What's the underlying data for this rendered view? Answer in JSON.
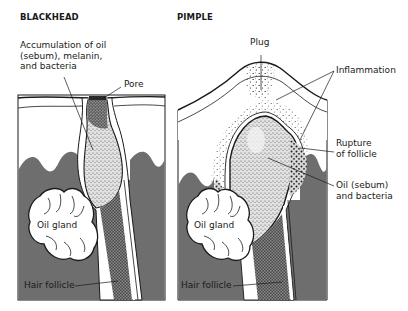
{
  "figure": {
    "panels": [
      {
        "id": "blackhead",
        "title": "BLACKHEAD",
        "labels": {
          "accumulation": [
            "Accumulation of oil",
            "(sebum), melanin,",
            "and bacteria"
          ],
          "pore": "Pore",
          "oil_gland": "Oil gland",
          "hair_follicle": "Hair follicle"
        }
      },
      {
        "id": "pimple",
        "title": "PIMPLE",
        "labels": {
          "plug": "Plug",
          "inflammation": "Inflammation",
          "rupture": [
            "Rupture",
            "of follicle"
          ],
          "oil_bacteria": [
            "Oil (sebum)",
            "and bacteria"
          ],
          "oil_gland": "Oil gland",
          "hair_follicle": "Hair follicle"
        }
      }
    ],
    "colors": {
      "dermis_gray": "#6e6e6e",
      "outline": "#1a1a1a",
      "background": "#ffffff",
      "stipple": "#9a9a9a",
      "dark_plug": "#555555"
    }
  }
}
